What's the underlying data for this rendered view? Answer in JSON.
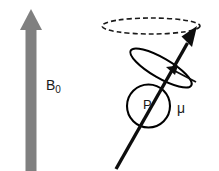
{
  "figure": {
    "title_text": "",
    "background_color": "#ffffff",
    "width": 219,
    "height": 171,
    "labels": {
      "field_symbol": "B",
      "field_subscript": "0",
      "angular_momentum": "P",
      "magnetic_moment": "μ"
    },
    "colors": {
      "field_arrow_gray": "#808080",
      "ink_black": "#1a1a1a",
      "stroke_black": "#000000",
      "background": "#ffffff"
    },
    "elements": {
      "field_arrow": {
        "name": "B0-field-arrow",
        "direction": "up",
        "shaft_x": 31,
        "shaft_top": 28,
        "shaft_bottom": 171,
        "shaft_width": 11,
        "head_tip_y": 9,
        "head_half_width": 11,
        "fill": "#808080"
      },
      "precession_ellipse": {
        "name": "precession-path-ellipse",
        "style": "dashed",
        "cx": 151,
        "cy": 26,
        "rx": 49,
        "ry": 8,
        "stroke": "#1a1a1a",
        "stroke_width": 1.6,
        "dash": "5 3"
      },
      "momentum_circle": {
        "name": "angular-momentum-circle",
        "cx": 148.5,
        "cy": 106,
        "r": 21.5,
        "stroke": "#000000",
        "stroke_width": 2.1,
        "fill": "#ffffff"
      },
      "spin_ellipse": {
        "name": "spin-rotation-ellipse",
        "cx": 161,
        "cy": 68,
        "rx": 35,
        "ry": 10,
        "rotation_deg": 30,
        "stroke": "#000000",
        "stroke_width": 2.0
      },
      "moment_arrow": {
        "name": "magnetic-moment-arrow",
        "tail_x": 116,
        "tail_y": 169,
        "tip_x": 197,
        "tip_y": 26,
        "stroke_width": 3.4,
        "head_length": 20,
        "head_width": 13,
        "fill": "#0d0d0d"
      },
      "rotation_arrow": {
        "name": "rotation-direction-arrow",
        "tail_x": 194,
        "tail_y": 80,
        "tip_x": 168,
        "tip_y": 68,
        "stroke_width": 2.0,
        "head_length": 10,
        "head_width": 7,
        "fill": "#0d0d0d"
      }
    }
  }
}
